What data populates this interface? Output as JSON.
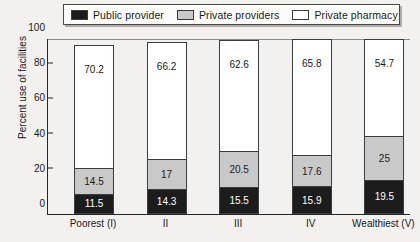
{
  "chart_data": {
    "type": "bar",
    "subtype": "stacked-vertical-100",
    "title": "",
    "xlabel": "",
    "ylabel": "Percent use of facilities",
    "ylim": [
      0,
      100
    ],
    "yticks": [
      0,
      20,
      40,
      60,
      80,
      100
    ],
    "ytick_labels": [
      "0",
      "20",
      "40",
      "60",
      "80",
      "100"
    ],
    "grid": false,
    "legend_position": "top",
    "categories": [
      "Poorest (I)",
      "II",
      "III",
      "IV",
      "Wealthiest (V)"
    ],
    "series": [
      {
        "name": "Public provider",
        "color": "#1c1c1c",
        "values": [
          11.5,
          14.3,
          15.5,
          15.9,
          19.5
        ],
        "labels": [
          "11.5",
          "14.3",
          "15.5",
          "15.9",
          "19.5"
        ]
      },
      {
        "name": "Private providers",
        "color": "#c9c9c9",
        "values": [
          14.5,
          17,
          20.5,
          17.6,
          25
        ],
        "labels": [
          "14.5",
          "17",
          "20.5",
          "17.6",
          "25"
        ]
      },
      {
        "name": "Private pharmacy",
        "color": "#ffffff",
        "values": [
          70.2,
          66.2,
          62.6,
          65.8,
          54.7
        ],
        "labels": [
          "70.2",
          "66.2",
          "62.6",
          "65.8",
          "54.7"
        ]
      }
    ]
  },
  "legend": {
    "items": [
      {
        "label": "Public provider",
        "swatch": "black-swatch-icon"
      },
      {
        "label": "Private providers",
        "swatch": "gray-swatch-icon"
      },
      {
        "label": "Private pharmacy",
        "swatch": "white-swatch-icon"
      }
    ]
  }
}
